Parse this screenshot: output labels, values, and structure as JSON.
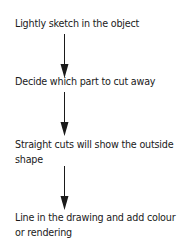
{
  "flowchart": {
    "steps": [
      {
        "label": "Lightly sketch in the object"
      },
      {
        "label": "Decide which part to cut away"
      },
      {
        "label": "Straight cuts will show the outside shape"
      },
      {
        "label": "Line in the drawing and add colour or rendering"
      }
    ],
    "arrow_color": "#1a1a1a"
  }
}
